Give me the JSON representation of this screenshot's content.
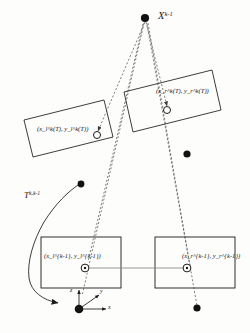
{
  "figure": {
    "kind": "geometry-diagram",
    "background_color": "#fdfdfc",
    "ink_color": "#1a1a1a"
  },
  "labels": {
    "world_point": {
      "base": "X",
      "sup": "k-1",
      "text": "X^{k-1}"
    },
    "upper_left_projection": {
      "text": "(x_l^k(T), y_l^k(T))"
    },
    "upper_right_projection": {
      "text": "(x_r^k(T), y_r^k(T))"
    },
    "lower_left_projection": {
      "text": "(x_l^{k-1}, y_l^{k-1})"
    },
    "lower_right_projection": {
      "text": "(x_r^{k-1}, y_r^{k-1})"
    },
    "transform": {
      "base": "T",
      "sup": "k,k-1",
      "text": "T^{k,k-1}"
    },
    "axis_x": "x",
    "axis_y": "y",
    "axis_z": "z"
  },
  "parts": {
    "upper_left_plane": "upper-left-image-plane",
    "upper_right_plane": "upper-right-image-plane",
    "lower_left_plane": "lower-left-image-plane",
    "lower_right_plane": "lower-right-image-plane",
    "baseline": "stereo-baseline",
    "projection_rays": "projection-ray-lines",
    "transform_arrow": "transform-arrow",
    "axis_triad": "coordinate-axis-triad"
  },
  "markers": {
    "feature_dots": 4,
    "projection_circles": 4
  }
}
